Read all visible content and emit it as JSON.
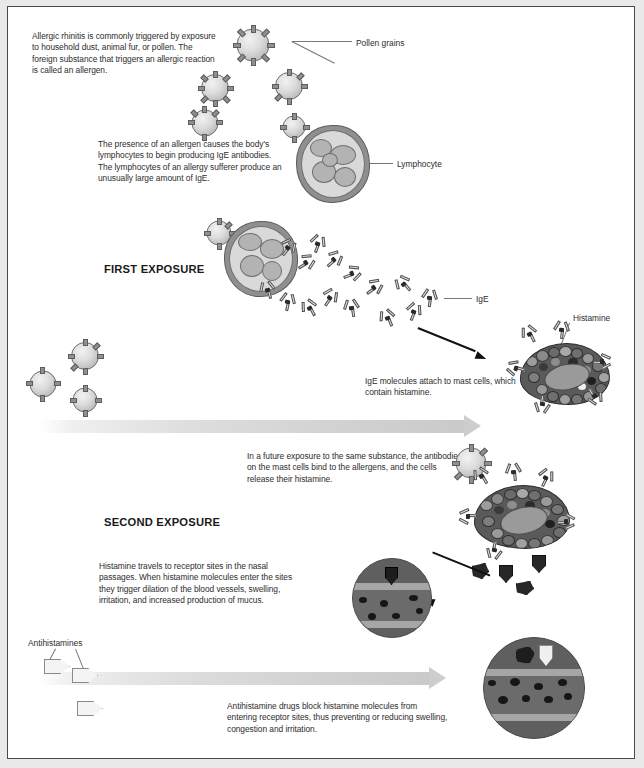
{
  "diagram": {
    "stages": [
      {
        "id": "first",
        "label": "FIRST EXPOSURE"
      },
      {
        "id": "second",
        "label": "SECOND EXPOSURE"
      }
    ],
    "paragraphs": [
      {
        "id": "intro",
        "text": "Allergic rhinitis is commonly triggered by exposure to household dust, animal fur, or pollen. The foreign substance that triggers an allergic reaction is called an allergen."
      },
      {
        "id": "lymphocyte-ige",
        "text": "The presence of an allergen causes the body's lymphocytes to begin producing IgE antibodies. The lymphocytes of an allergy sufferer produce an unusually large amount of IgE."
      },
      {
        "id": "mast-attach",
        "text": "IgE molecules attach to mast cells, which contain histamine."
      },
      {
        "id": "future-exposure",
        "text": "In a future exposure to the same substance, the antibodies on the mast cells bind to the allergens, and the cells release their histamine."
      },
      {
        "id": "histamine-receptors",
        "text": "Histamine travels to receptor sites in the nasal passages. When histamine molecules enter the sites they trigger dilation of the blood vessels, swelling, irritation, and increased production of mucus."
      },
      {
        "id": "antihistamine-block",
        "text": "Antihistamine drugs block histamine molecules from entering receptor sites, thus preventing or reducing swelling, congestion and irritation."
      }
    ],
    "callouts": [
      {
        "id": "pollen-grains",
        "label": "Pollen grains"
      },
      {
        "id": "lymphocyte",
        "label": "Lymphocyte"
      },
      {
        "id": "ige",
        "label": "IgE"
      },
      {
        "id": "histamine",
        "label": "Histamine"
      },
      {
        "id": "antihistamines",
        "label": "Antihistamines"
      }
    ],
    "colors": {
      "background": "#ffffff",
      "page_margin": "#e9e9e9",
      "frame_border": "#4a4a4a",
      "text": "#2d2d2d",
      "stage_text": "#1a1a1a",
      "timeline_arrow": "#cdcdcd",
      "pointer_arrow": "#111111",
      "pollen_fill": "#dcdcdc",
      "lymphocyte_fill": "#8f8f8f",
      "mast_cell_fill": "#5a5a5a",
      "histamine_fill": "#272727",
      "antihistamine_fill": "#f4f4f4",
      "nasal_tissue": "#5f5f5f",
      "nasal_band": "#a6a6a6"
    }
  }
}
